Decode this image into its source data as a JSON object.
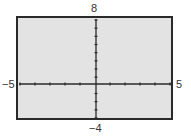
{
  "chart_data": {
    "type": "line",
    "title": "",
    "xlabel": "",
    "ylabel": "",
    "xlim": [
      -5,
      5
    ],
    "ylim": [
      -4,
      8
    ],
    "x_tick_step": 1,
    "y_tick_step": 1,
    "grid": false,
    "series": [],
    "window_labels": {
      "xmin": "−5",
      "xmax": "5",
      "ymin": "−4",
      "ymax": "8"
    }
  },
  "colors": {
    "background": "#e3e3e3",
    "axis": "#2a2a2a",
    "frame": "#2a2a2a"
  }
}
